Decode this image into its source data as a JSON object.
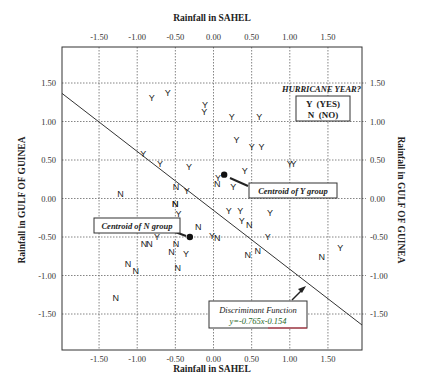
{
  "chart_data": {
    "type": "scatter",
    "title": "",
    "xlabel": "Rainfall in SAHEL",
    "ylabel": "Rainfall in GULF OF GUINEA",
    "xlim": [
      -2.0,
      1.97
    ],
    "ylim": [
      -1.97,
      1.96
    ],
    "x_ticks": [
      "-1.50",
      "-1.00",
      "-0.50",
      "0.00",
      "0.50",
      "1.00",
      "1.50"
    ],
    "y_ticks": [
      "1.50",
      "1.00",
      "0.50",
      "0.00",
      "-0.50",
      "-1.00",
      "-1.50"
    ],
    "x_tick_values": [
      -1.5,
      -1.0,
      -0.5,
      0.0,
      0.5,
      1.0,
      1.5
    ],
    "y_tick_values": [
      1.5,
      1.0,
      0.5,
      0.0,
      -0.5,
      -1.0,
      -1.5
    ],
    "grid": true,
    "axes_mirrored": true,
    "legend": {
      "title": "HURRICANE YEAR?",
      "entries": [
        {
          "symbol": "Y",
          "label": "Y  (YES)"
        },
        {
          "symbol": "N",
          "label": "N  (NO)"
        }
      ],
      "position": "upper right"
    },
    "series": [
      {
        "name": "Y (YES)",
        "marker": "Y",
        "points": [
          [
            -0.81,
            1.31
          ],
          [
            -0.6,
            1.38
          ],
          [
            -0.11,
            1.22
          ],
          [
            -0.12,
            1.13
          ],
          [
            0.24,
            1.07
          ],
          [
            0.6,
            1.06
          ],
          [
            0.3,
            0.76
          ],
          [
            0.5,
            0.67
          ],
          [
            0.63,
            0.67
          ],
          [
            -0.92,
            0.59
          ],
          [
            -0.7,
            0.46
          ],
          [
            -0.32,
            0.41
          ],
          [
            0.41,
            0.37
          ],
          [
            1.0,
            0.46
          ],
          [
            1.05,
            0.46
          ],
          [
            0.06,
            0.27
          ],
          [
            0.26,
            0.16
          ],
          [
            -0.35,
            0.11
          ],
          [
            -0.46,
            -0.2
          ],
          [
            0.2,
            -0.15
          ],
          [
            0.35,
            -0.15
          ],
          [
            0.74,
            -0.18
          ],
          [
            0.37,
            -0.29
          ],
          [
            -0.02,
            -0.48
          ],
          [
            0.71,
            -0.49
          ],
          [
            -0.74,
            -0.49
          ],
          [
            -0.36,
            -0.71
          ],
          [
            1.66,
            -0.64
          ]
        ]
      },
      {
        "name": "N (NO)",
        "marker": "N",
        "points": [
          [
            -1.22,
            0.07
          ],
          [
            -0.49,
            0.16
          ],
          [
            -0.5,
            -0.07
          ],
          [
            0.05,
            0.19
          ],
          [
            -0.2,
            -0.37
          ],
          [
            -0.5,
            -0.07
          ],
          [
            0.47,
            -0.34
          ],
          [
            -0.91,
            -0.58
          ],
          [
            -0.84,
            -0.58
          ],
          [
            -0.49,
            -0.58
          ],
          [
            -0.55,
            -0.69
          ],
          [
            0.05,
            -0.51
          ],
          [
            0.58,
            -0.67
          ],
          [
            0.45,
            -0.73
          ],
          [
            1.42,
            -0.75
          ],
          [
            -1.12,
            -0.84
          ],
          [
            -1.02,
            -0.93
          ],
          [
            -0.47,
            -0.89
          ],
          [
            -1.28,
            -1.28
          ]
        ]
      }
    ],
    "centroids": [
      {
        "label": "Centroid of Y group",
        "x": 0.14,
        "y": 0.31
      },
      {
        "label": "Centroid of N group",
        "x": -0.31,
        "y": -0.5
      }
    ],
    "discriminant": {
      "label": "Discriminant Function",
      "equation": "y=-0.765x-0.154",
      "slope": -0.765,
      "intercept": -0.154
    }
  },
  "labels": {
    "x_top_title": "Rainfall in SAHEL",
    "x_bottom_title": "Rainfall in SAHEL",
    "y_left_title": "Rainfall in GULF OF GUINEA",
    "y_right_title": "Rainfall in GULF OF GUINEA",
    "legend_title": "HURRICANE YEAR?",
    "legend_yes": "Y  (YES)",
    "legend_no": "N  (NO)",
    "centroid_y": "Centroid of Y group",
    "centroid_n": "Centroid of N group",
    "discriminant_title": "Discriminant Function",
    "discriminant_eq": "y=-0.765x-0.154"
  },
  "colors": {
    "frame": "#333333",
    "grid": "#666666",
    "line": "#333333",
    "equation": "#2a6a2a",
    "box_accent_red": "#cc3344",
    "box_accent_blue": "#5566cc"
  }
}
